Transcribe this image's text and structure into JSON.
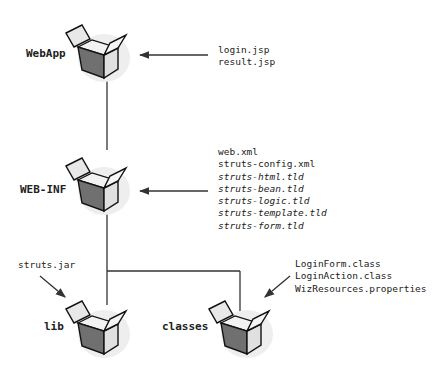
{
  "diagram": {
    "nodes": [
      {
        "id": "webapp",
        "label": "WebApp",
        "files": [
          {
            "name": "login.jsp",
            "italic": false
          },
          {
            "name": "result.jsp",
            "italic": false
          }
        ]
      },
      {
        "id": "webinf",
        "label": "WEB-INF",
        "files": [
          {
            "name": "web.xml",
            "italic": false
          },
          {
            "name": "struts-config.xml",
            "italic": false
          },
          {
            "name": "struts-html.tld",
            "italic": true
          },
          {
            "name": "struts-bean.tld",
            "italic": true
          },
          {
            "name": "struts-logic.tld",
            "italic": true
          },
          {
            "name": "struts-template.tld",
            "italic": true
          },
          {
            "name": "struts-form.tld",
            "italic": true
          }
        ]
      },
      {
        "id": "lib",
        "label": "lib",
        "files": [
          {
            "name": "struts.jar",
            "italic": false
          }
        ]
      },
      {
        "id": "classes",
        "label": "classes",
        "files": [
          {
            "name": "LoginForm.class",
            "italic": false
          },
          {
            "name": "LoginAction.class",
            "italic": false
          },
          {
            "name": "WizResources.properties",
            "italic": false
          }
        ]
      }
    ],
    "edges": [
      {
        "from": "webapp",
        "to": "webinf"
      },
      {
        "from": "webinf",
        "to": "lib"
      },
      {
        "from": "webinf",
        "to": "classes"
      }
    ],
    "icon": "open-box-icon",
    "colors": {
      "line": "#333333",
      "box_dark": "#6e6e6e",
      "box_light": "#d9d9d9"
    }
  }
}
